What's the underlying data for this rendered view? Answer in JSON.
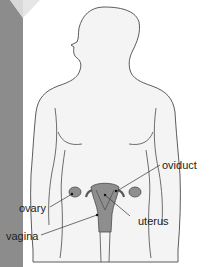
{
  "diagram": {
    "labels": {
      "oviduct": "oviduct",
      "ovary": "ovary",
      "uterus": "uterus",
      "vagina": "vagina"
    },
    "colors": {
      "strip": "#8c8c8c",
      "body_fill": "#f4f4f4",
      "outline": "#4a4a4a",
      "organ_fill": "#8e8e8e",
      "organ_dark": "#5a5a5a",
      "label_text": "#222222"
    }
  }
}
